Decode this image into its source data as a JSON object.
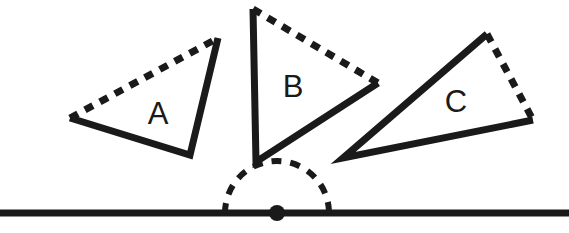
{
  "figure": {
    "width": 569,
    "height": 233,
    "background_color": "#ffffff",
    "ink_color": "#1a1a1a"
  },
  "baseline": {
    "name": "horizontal-line",
    "x1": 0,
    "y1": 213,
    "x2": 569,
    "y2": 213,
    "stroke_width": 7,
    "color": "#1a1a1a"
  },
  "pivot": {
    "name": "center-of-rotation-dot",
    "cx": 277,
    "cy": 213,
    "r": 8,
    "color": "#1a1a1a"
  },
  "arc": {
    "name": "dashed-semicircle",
    "cx": 277,
    "cy": 213,
    "r": 52,
    "start_angle_deg": 180,
    "end_angle_deg": 0,
    "stroke_width": 6,
    "dash": "10 9",
    "color": "#1a1a1a"
  },
  "triangles": [
    {
      "label": "A",
      "label_x": 158,
      "label_y": 116,
      "label_size": 31,
      "stroke_width": 7,
      "dash": "9 8",
      "vertices": {
        "left": [
          70,
          118
        ],
        "top": [
          218,
          38
        ],
        "bottom_right": [
          190,
          155
        ]
      },
      "solid_path": "M 70 118 L 190 155 L 218 38",
      "dashed_path": "M 70 118 L 218 38"
    },
    {
      "label": "B",
      "label_x": 293,
      "label_y": 89,
      "label_size": 31,
      "stroke_width": 7,
      "dash": "9 8",
      "vertices": {
        "top": [
          253,
          9
        ],
        "bottom": [
          256,
          162
        ],
        "right": [
          378,
          83
        ]
      },
      "solid_path": "M 253 9 L 256 162 L 378 83",
      "dashed_path": "M 253 9 L 378 83"
    },
    {
      "label": "C",
      "label_x": 456,
      "label_y": 104,
      "label_size": 31,
      "stroke_width": 7,
      "dash": "9 8",
      "vertices": {
        "left": [
          343,
          158
        ],
        "top": [
          487,
          34
        ],
        "right": [
          533,
          120
        ]
      },
      "solid_path": "M 487 34 L 343 158 L 533 120",
      "dashed_path": "M 487 34 L 533 120"
    }
  ]
}
